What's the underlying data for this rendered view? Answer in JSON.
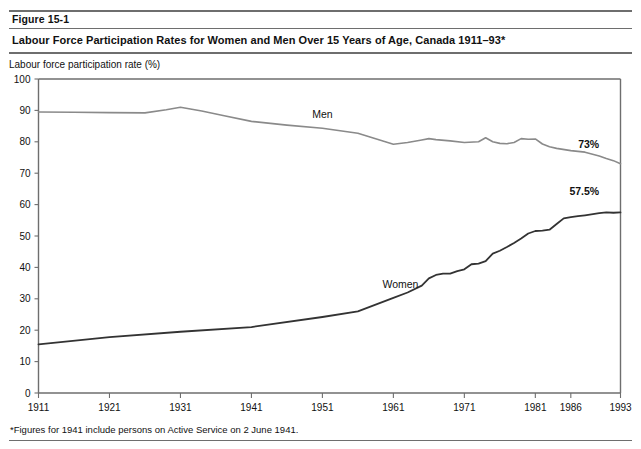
{
  "figure": {
    "number": "Figure 15-1",
    "title": "Labour Force Participation Rates for Women and Men Over 15 Years of Age, Canada 1911–93*",
    "footnote": "*Figures for 1941 include persons on Active Service on 2 June 1941."
  },
  "chart_data": {
    "type": "line",
    "title": "Labour Force Participation Rates for Women and Men Over 15 Years of Age, Canada 1911–93*",
    "xlabel": "",
    "ylabel": "Labour force participation rate (%)",
    "ylim": [
      0,
      100
    ],
    "xlim": [
      1911,
      1993
    ],
    "yticks": [
      0,
      10,
      20,
      30,
      40,
      50,
      60,
      70,
      80,
      90,
      100
    ],
    "xticks": [
      1911,
      1921,
      1931,
      1941,
      1951,
      1961,
      1971,
      1981,
      1986,
      1993
    ],
    "grid": false,
    "legend_position": "inline-labels",
    "annotations": [
      {
        "text": "Men",
        "x": 1951,
        "y": 87.5
      },
      {
        "text": "Women",
        "x": 1962,
        "y": 33.5
      },
      {
        "text": "73%",
        "x": 1990,
        "y": 78.0
      },
      {
        "text": "57.5%",
        "x": 1990,
        "y": 63.0
      }
    ],
    "series": [
      {
        "name": "Men",
        "color": "#8a8a8a",
        "end_value_label": "73%",
        "x": [
          1911,
          1916,
          1921,
          1926,
          1929,
          1931,
          1934,
          1937,
          1941,
          1946,
          1951,
          1956,
          1961,
          1963,
          1965,
          1966,
          1967,
          1969,
          1971,
          1973,
          1974,
          1975,
          1976,
          1977,
          1978,
          1979,
          1980,
          1981,
          1982,
          1983,
          1984,
          1986,
          1988,
          1990,
          1991,
          1992,
          1993
        ],
        "y": [
          89.5,
          89.4,
          89.3,
          89.2,
          90.2,
          91.0,
          89.8,
          88.4,
          86.5,
          85.3,
          84.3,
          82.7,
          79.2,
          79.8,
          80.6,
          81.0,
          80.7,
          80.3,
          79.8,
          80.0,
          81.3,
          80.0,
          79.5,
          79.4,
          79.8,
          81.0,
          80.8,
          80.9,
          79.3,
          78.4,
          77.9,
          77.2,
          76.7,
          75.5,
          74.7,
          74.0,
          73.0
        ]
      },
      {
        "name": "Women",
        "color": "#333333",
        "end_value_label": "57.5%",
        "x": [
          1911,
          1921,
          1931,
          1941,
          1951,
          1956,
          1961,
          1963,
          1965,
          1966,
          1967,
          1968,
          1969,
          1970,
          1971,
          1972,
          1973,
          1974,
          1975,
          1976,
          1977,
          1978,
          1979,
          1980,
          1981,
          1982,
          1983,
          1984,
          1985,
          1986,
          1987,
          1988,
          1990,
          1991,
          1992,
          1993
        ],
        "y": [
          15.5,
          17.8,
          19.5,
          21.0,
          24.2,
          26.0,
          30.3,
          32.0,
          34.2,
          36.5,
          37.6,
          38.0,
          38.0,
          38.8,
          39.4,
          41.0,
          41.2,
          42.0,
          44.4,
          45.3,
          46.5,
          47.8,
          49.2,
          50.8,
          51.6,
          51.7,
          52.0,
          53.8,
          55.6,
          56.0,
          56.3,
          56.6,
          57.3,
          57.5,
          57.4,
          57.5
        ]
      }
    ]
  }
}
